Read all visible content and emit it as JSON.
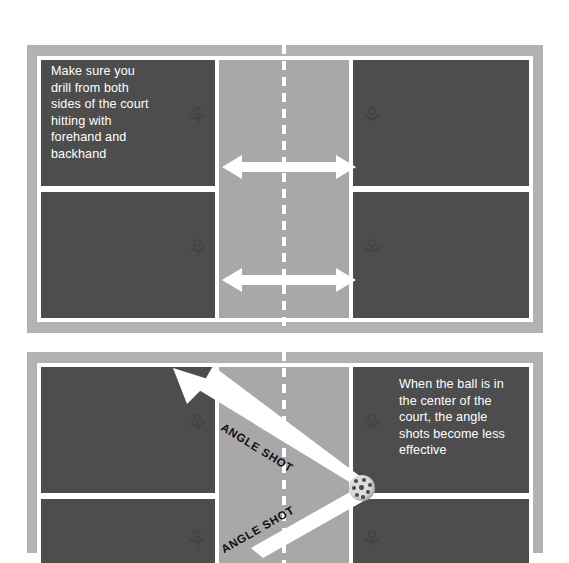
{
  "figures": [
    {
      "id": "drill-court",
      "callout": "Make sure you\ndrill from both\nsides of the court\nhitting with\nforehand and\nbackhand",
      "arrows": [
        {
          "name": "kitchen-arrow-top",
          "direction": "double-horizontal"
        },
        {
          "name": "kitchen-arrow-bottom",
          "direction": "double-horizontal"
        }
      ]
    },
    {
      "id": "angle-shot-court",
      "callout": "When the ball is in\nthe center of the\ncourt, the angle\nshots become less\neffective",
      "arrows": [
        {
          "name": "angle-shot-upper",
          "label": "ANGLE SHOT",
          "direction": "diagonal-up-left"
        },
        {
          "name": "angle-shot-lower",
          "label": "ANGLE SHOT",
          "direction": "diagonal-down-left"
        }
      ],
      "ball": {
        "name": "pickleball",
        "label": "pickleball"
      }
    }
  ],
  "colors": {
    "court_surface": "#4d4d4d",
    "kitchen": "#a8a8a8",
    "surround": "#b2b2b2",
    "lines": "#ffffff",
    "arrow": "#ffffff",
    "callout_text": "#ffffff",
    "diag_label_text": "#101010",
    "page_background": "#ffffff"
  },
  "watermark_glyph": "⚘"
}
